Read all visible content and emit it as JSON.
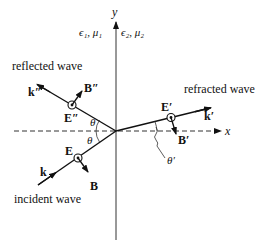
{
  "diagram": {
    "axes": {
      "x_label": "x",
      "y_label": "y"
    },
    "media": {
      "left": "ϵ₁, μ₁",
      "right": "ϵ₂, μ₂"
    },
    "waves": {
      "incident": {
        "label": "incident wave",
        "k": "k",
        "E": "E",
        "B": "B",
        "angle": "θ"
      },
      "reflected": {
        "label": "reflected wave",
        "k": "k″",
        "E": "E″",
        "B": "B″",
        "angle": "θ"
      },
      "refracted": {
        "label": "refracted wave",
        "k": "k′",
        "E": "E′",
        "B": "B′",
        "angle": "θ′"
      }
    }
  }
}
